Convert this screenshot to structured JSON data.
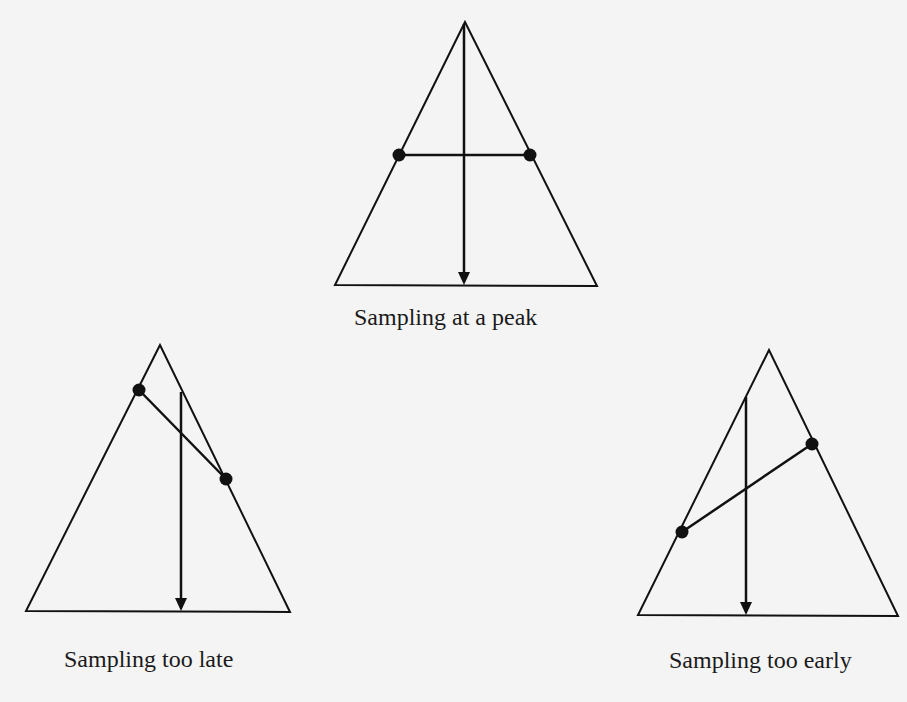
{
  "diagram": {
    "background": "#f4f4f4",
    "stroke_color": "#111111",
    "panels": [
      {
        "id": "peak",
        "label": "Sampling at a peak",
        "triangle": [
          [
            465,
            22
          ],
          [
            335,
            285
          ],
          [
            597,
            286
          ]
        ],
        "segment": [
          [
            399,
            155
          ],
          [
            530,
            155
          ]
        ],
        "dots": [
          [
            399,
            155
          ],
          [
            530,
            155
          ]
        ],
        "arrow": [
          [
            464,
            24
          ],
          [
            464,
            285
          ]
        ],
        "label_pos": [
          354,
          305
        ]
      },
      {
        "id": "late",
        "label": "Sampling too late",
        "triangle": [
          [
            160,
            345
          ],
          [
            26,
            611
          ],
          [
            290,
            612
          ]
        ],
        "segment": [
          [
            139,
            390
          ],
          [
            226,
            479
          ]
        ],
        "dots": [
          [
            139,
            390
          ],
          [
            226,
            479
          ]
        ],
        "arrow": [
          [
            181,
            392
          ],
          [
            181,
            611
          ]
        ],
        "label_pos": [
          64,
          647
        ]
      },
      {
        "id": "early",
        "label": "Sampling too early",
        "triangle": [
          [
            769,
            350
          ],
          [
            638,
            615
          ],
          [
            898,
            616
          ]
        ],
        "segment": [
          [
            682,
            532
          ],
          [
            812,
            444
          ]
        ],
        "dots": [
          [
            682,
            532
          ],
          [
            812,
            444
          ]
        ],
        "arrow": [
          [
            746,
            397
          ],
          [
            746,
            615
          ]
        ],
        "label_pos": [
          669,
          648
        ]
      }
    ]
  }
}
